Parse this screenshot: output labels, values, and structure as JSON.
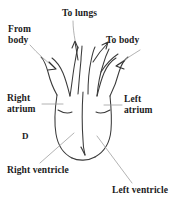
{
  "figure": {
    "marker": "D",
    "background_color": "#ffffff",
    "ink_color": "#3a3a3a",
    "leader_color": "#9a9a9a",
    "text_color": "#1b1b1b"
  },
  "labels": {
    "to_lungs": "To lungs",
    "from_body_line1": "From",
    "from_body_line2": "body",
    "to_body": "To body",
    "right_atrium_line1": "Right",
    "right_atrium_line2": "atrium",
    "left_atrium_line1": "Left",
    "left_atrium_line2": "atrium",
    "right_ventricle": "Right ventricle",
    "left_ventricle": "Left ventricle"
  }
}
